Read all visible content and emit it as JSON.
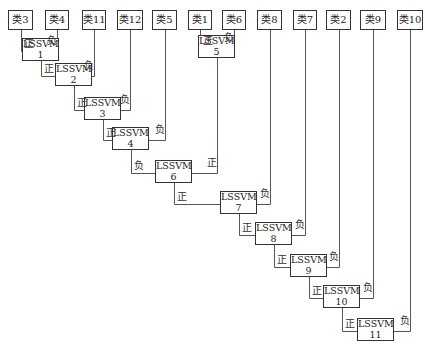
{
  "diagram": {
    "type": "binary-tree-classifier",
    "classes": [
      {
        "id": "c3",
        "label": "类3",
        "x": 8,
        "y": 10,
        "w": 25
      },
      {
        "id": "c4",
        "label": "类4",
        "x": 45,
        "y": 10,
        "w": 24
      },
      {
        "id": "c11",
        "label": "类11",
        "x": 82,
        "y": 10,
        "w": 24
      },
      {
        "id": "c12",
        "label": "类12",
        "x": 117,
        "y": 10,
        "w": 26
      },
      {
        "id": "c5",
        "label": "类5",
        "x": 152,
        "y": 10,
        "w": 25
      },
      {
        "id": "c1",
        "label": "类1",
        "x": 188,
        "y": 10,
        "w": 24
      },
      {
        "id": "c6",
        "label": "类6",
        "x": 222,
        "y": 10,
        "w": 24
      },
      {
        "id": "c8",
        "label": "类8",
        "x": 257,
        "y": 10,
        "w": 25
      },
      {
        "id": "c7",
        "label": "类7",
        "x": 293,
        "y": 10,
        "w": 24
      },
      {
        "id": "c2",
        "label": "类2",
        "x": 326,
        "y": 10,
        "w": 25
      },
      {
        "id": "c9",
        "label": "类9",
        "x": 360,
        "y": 10,
        "w": 26
      },
      {
        "id": "c10",
        "label": "类10",
        "x": 397,
        "y": 10,
        "w": 26
      }
    ],
    "classifiers": [
      {
        "id": "s1",
        "name": "LSSVM",
        "num": "1",
        "x": 22,
        "y": 38
      },
      {
        "id": "s2",
        "name": "LSSVM",
        "num": "2",
        "x": 55,
        "y": 63
      },
      {
        "id": "s3",
        "name": "LSSVM",
        "num": "3",
        "x": 84,
        "y": 97
      },
      {
        "id": "s4",
        "name": "LSSVM",
        "num": "4",
        "x": 112,
        "y": 127
      },
      {
        "id": "s5",
        "name": "LSSVM",
        "num": "5",
        "x": 198,
        "y": 35
      },
      {
        "id": "s6",
        "name": "LSSVM",
        "num": "6",
        "x": 155,
        "y": 160
      },
      {
        "id": "s7",
        "name": "LSSVM",
        "num": "7",
        "x": 220,
        "y": 191
      },
      {
        "id": "s8",
        "name": "LSSVM",
        "num": "8",
        "x": 255,
        "y": 222
      },
      {
        "id": "s9",
        "name": "LSSVM",
        "num": "9",
        "x": 290,
        "y": 254
      },
      {
        "id": "s10",
        "name": "LSSVM",
        "num": "10",
        "x": 323,
        "y": 285
      },
      {
        "id": "s11",
        "name": "LSSVM",
        "num": "11",
        "x": 357,
        "y": 318
      }
    ],
    "edge_labels": {
      "positive": "正",
      "negative": "负"
    },
    "edges": [
      {
        "from": "c3",
        "to": "s1",
        "side": "left",
        "label": "正"
      },
      {
        "from": "c4",
        "to": "s1",
        "side": "right",
        "label": "负"
      },
      {
        "from": "s1",
        "to": "s2",
        "side": "left",
        "label": "正"
      },
      {
        "from": "c11",
        "to": "s2",
        "side": "right",
        "label": "负"
      },
      {
        "from": "s2",
        "to": "s3",
        "side": "left",
        "label": "正"
      },
      {
        "from": "c12",
        "to": "s3",
        "side": "right",
        "label": "负"
      },
      {
        "from": "s3",
        "to": "s4",
        "side": "left",
        "label": "正"
      },
      {
        "from": "c5",
        "to": "s4",
        "side": "right",
        "label": "负"
      },
      {
        "from": "c1",
        "to": "s5",
        "side": "left",
        "label": "正"
      },
      {
        "from": "c6",
        "to": "s5",
        "side": "right",
        "label": "负"
      },
      {
        "from": "s4",
        "to": "s6",
        "side": "left",
        "label": "负"
      },
      {
        "from": "s5",
        "to": "s6",
        "side": "right",
        "label": "正"
      },
      {
        "from": "s6",
        "to": "s7",
        "side": "left",
        "label": "正"
      },
      {
        "from": "c8",
        "to": "s7",
        "side": "right",
        "label": "负"
      },
      {
        "from": "s7",
        "to": "s8",
        "side": "left",
        "label": "正"
      },
      {
        "from": "c7",
        "to": "s8",
        "side": "right",
        "label": "负"
      },
      {
        "from": "s8",
        "to": "s9",
        "side": "left",
        "label": "正"
      },
      {
        "from": "c2",
        "to": "s9",
        "side": "right",
        "label": "负"
      },
      {
        "from": "s9",
        "to": "s10",
        "side": "left",
        "label": "正"
      },
      {
        "from": "c9",
        "to": "s10",
        "side": "right",
        "label": "负"
      },
      {
        "from": "s10",
        "to": "s11",
        "side": "left",
        "label": "正"
      },
      {
        "from": "c10",
        "to": "s11",
        "side": "right",
        "label": "负"
      }
    ]
  },
  "colors": {
    "line": "#555555",
    "border": "#333333",
    "background": "#ffffff"
  }
}
